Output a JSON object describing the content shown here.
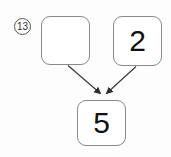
{
  "canvas": {
    "width": 171,
    "height": 157,
    "background_color": "#fdfdfd"
  },
  "step_label": {
    "text": "13",
    "shape": "circled-number",
    "color": "#333333"
  },
  "nodes": [
    {
      "id": "left",
      "name": "empty-node",
      "value": "",
      "border_color": "#8a8a8a",
      "fill_color": "#ffffff"
    },
    {
      "id": "right",
      "name": "value-node-2",
      "value": "2",
      "border_color": "#8a8a8a",
      "fill_color": "#ffffff"
    },
    {
      "id": "bottom",
      "name": "result-node-5",
      "value": "5",
      "border_color": "#8a8a8a",
      "fill_color": "#ffffff"
    }
  ],
  "edges": [
    {
      "id": "edge-left-to-bottom",
      "from": "left",
      "to": "bottom",
      "stroke_color": "#3a3a3a",
      "arrowhead": "filled-triangle"
    },
    {
      "id": "edge-right-to-bottom",
      "from": "right",
      "to": "bottom",
      "stroke_color": "#3a3a3a",
      "arrowhead": "filled-triangle"
    }
  ]
}
